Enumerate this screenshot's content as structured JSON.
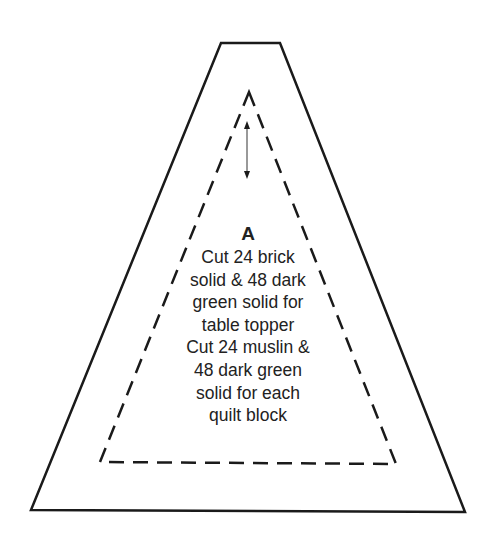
{
  "diagram": {
    "type": "quilt-template",
    "shape": "trapezoid-with-triangle",
    "colors": {
      "stroke": "#1a1a1a",
      "text": "#222222",
      "arrow": "#555555",
      "background": "#ffffff"
    },
    "outer_trapezoid": {
      "points": [
        [
          221,
          43
        ],
        [
          280,
          43
        ],
        [
          465,
          512
        ],
        [
          31,
          510
        ]
      ],
      "style": "solid"
    },
    "inner_triangle": {
      "points": [
        [
          249,
          92
        ],
        [
          396,
          464
        ],
        [
          100,
          462
        ]
      ],
      "style": "dashed",
      "meaning": "seam line"
    },
    "grain_arrow": {
      "from": [
        247,
        122
      ],
      "to": [
        247,
        178
      ],
      "style": "double-headed"
    },
    "label": {
      "piece": "A",
      "lines": [
        "Cut 24 brick",
        "solid & 48 dark",
        "green solid for",
        "table topper",
        "Cut 24 muslin &",
        "48 dark green",
        "solid for each",
        "quilt block"
      ]
    }
  }
}
